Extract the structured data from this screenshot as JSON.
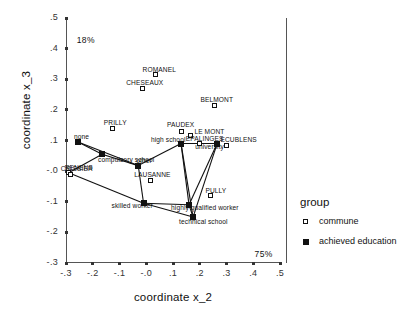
{
  "chart_data": {
    "type": "scatter",
    "title": "",
    "xlabel": "coordinate x_2",
    "ylabel": "coordinate x_3",
    "xlim": [
      -0.3,
      0.5
    ],
    "ylim": [
      -0.3,
      0.5
    ],
    "xticks": [
      "-.3",
      "-.2",
      "-.1",
      "-.0",
      ".1",
      ".2",
      ".3",
      ".4",
      ".5"
    ],
    "xtick_values": [
      -0.3,
      -0.2,
      -0.1,
      0.0,
      0.1,
      0.2,
      0.3,
      0.4,
      0.5
    ],
    "yticks": [
      ".5",
      ".4",
      ".3",
      ".2",
      ".1",
      "-.0",
      "-.1",
      "-.2",
      "-.3"
    ],
    "ytick_values": [
      0.5,
      0.4,
      0.3,
      0.2,
      0.1,
      0.0,
      -0.1,
      -0.2,
      -0.3
    ],
    "grid": false,
    "legend_position": "right",
    "annotations": [
      {
        "text": "18%",
        "x": -0.26,
        "y": 0.445,
        "name": "inertia-y-axis"
      },
      {
        "text": "75%",
        "x": 0.405,
        "y": -0.255,
        "name": "inertia-x-axis"
      }
    ],
    "series": [
      {
        "name": "commune",
        "marker": "open-square",
        "points": [
          {
            "label": "ROMANEL",
            "x": 0.035,
            "y": 0.315
          },
          {
            "label": "CHESEAUX",
            "x": -0.015,
            "y": 0.27
          },
          {
            "label": "BELMONT",
            "x": 0.255,
            "y": 0.215
          },
          {
            "label": "PRILLY",
            "x": -0.125,
            "y": 0.14
          },
          {
            "label": "PAUDEX",
            "x": 0.13,
            "y": 0.13
          },
          {
            "label": "LE MONT",
            "x": 0.165,
            "y": 0.115
          },
          {
            "label": "EPALINGES",
            "x": 0.2,
            "y": 0.09
          },
          {
            "label": "ECUBLENS",
            "x": 0.3,
            "y": 0.085
          },
          {
            "label": "RENENS",
            "x": -0.29,
            "y": -0.005
          },
          {
            "label": "CRISSIER",
            "x": -0.282,
            "y": -0.012
          },
          {
            "label": "LAUSANNE",
            "x": 0.015,
            "y": -0.03
          },
          {
            "label": "PULLY",
            "x": 0.24,
            "y": -0.08
          }
        ]
      },
      {
        "name": "achieved education",
        "marker": "filled-square",
        "points": [
          {
            "label": "none",
            "x": -0.255,
            "y": 0.095
          },
          {
            "label": "compulsory school",
            "x": -0.165,
            "y": 0.055
          },
          {
            "label": "other",
            "x": -0.03,
            "y": 0.018
          },
          {
            "label": "high school",
            "x": 0.13,
            "y": 0.09
          },
          {
            "label": "university",
            "x": 0.265,
            "y": 0.09
          },
          {
            "label": "skilled worker",
            "x": -0.01,
            "y": -0.105
          },
          {
            "label": "highly qualified worker",
            "x": 0.16,
            "y": -0.11
          },
          {
            "label": "technical school",
            "x": 0.175,
            "y": -0.15
          }
        ]
      }
    ],
    "connector_lines": [
      [
        [
          -0.255,
          0.095
        ],
        [
          -0.165,
          0.055
        ]
      ],
      [
        [
          -0.165,
          0.055
        ],
        [
          -0.03,
          0.018
        ]
      ],
      [
        [
          -0.03,
          0.018
        ],
        [
          0.13,
          0.09
        ]
      ],
      [
        [
          0.13,
          0.09
        ],
        [
          0.265,
          0.09
        ]
      ],
      [
        [
          -0.255,
          0.095
        ],
        [
          -0.03,
          0.018
        ]
      ],
      [
        [
          -0.01,
          -0.105
        ],
        [
          0.16,
          -0.11
        ]
      ],
      [
        [
          0.16,
          -0.11
        ],
        [
          0.175,
          -0.15
        ]
      ],
      [
        [
          0.13,
          0.09
        ],
        [
          0.175,
          -0.15
        ]
      ],
      [
        [
          0.13,
          0.09
        ],
        [
          0.16,
          -0.11
        ]
      ],
      [
        [
          0.265,
          0.09
        ],
        [
          0.175,
          -0.15
        ]
      ],
      [
        [
          0.265,
          0.09
        ],
        [
          0.16,
          -0.11
        ]
      ],
      [
        [
          -0.03,
          0.018
        ],
        [
          -0.01,
          -0.105
        ]
      ],
      [
        [
          -0.01,
          -0.105
        ],
        [
          0.175,
          -0.15
        ]
      ],
      [
        [
          -0.29,
          -0.005
        ],
        [
          -0.01,
          -0.105
        ]
      ],
      [
        [
          -0.29,
          -0.005
        ],
        [
          -0.165,
          0.055
        ]
      ]
    ]
  },
  "legend": {
    "title": "group",
    "items": [
      {
        "label": "commune",
        "marker": "open-square"
      },
      {
        "label": "achieved education",
        "marker": "filled-square"
      }
    ]
  }
}
